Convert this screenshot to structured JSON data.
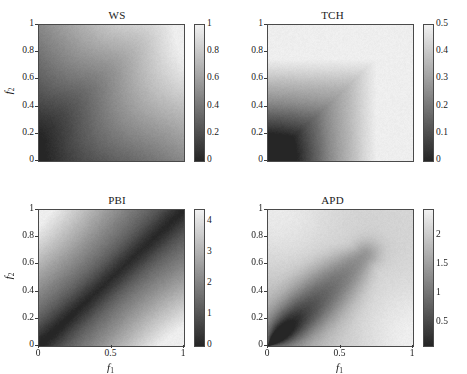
{
  "figure": {
    "background": "#ffffff",
    "colormap": "grayscale",
    "colormap_low": "#262626",
    "colormap_high": "#f2f2f2",
    "axis_label_x": "f",
    "axis_label_x_sub": "1",
    "axis_label_y": "f",
    "axis_label_y_sub": "2",
    "x_ticks": [
      "0",
      "0.5",
      "1"
    ],
    "x_tick_values": [
      0,
      0.5,
      1
    ],
    "y_ticks": [
      "0",
      "0.2",
      "0.4",
      "0.6",
      "0.8",
      "1"
    ],
    "y_tick_values": [
      0,
      0.2,
      0.4,
      0.6,
      0.8,
      1
    ]
  },
  "chart_data": [
    {
      "type": "heatmap",
      "title": "WS",
      "xlabel": "f1",
      "ylabel": "f2",
      "xlim": [
        0,
        1
      ],
      "ylim": [
        0,
        1
      ],
      "x_ticks": [
        0,
        0.5,
        1
      ],
      "x_tick_labels": [
        "0",
        "0.5",
        "1"
      ],
      "y_ticks": [
        0,
        0.2,
        0.4,
        0.6,
        0.8,
        1
      ],
      "y_tick_labels": [
        "0",
        "0.2",
        "0.4",
        "0.6",
        "0.8",
        "1"
      ],
      "colorbar": {
        "ticks": [
          0,
          0.2,
          0.4,
          0.6,
          0.8,
          1
        ],
        "tick_labels": [
          "0",
          "0.2",
          "0.4",
          "0.6",
          "0.8",
          "1"
        ],
        "vmin": 0,
        "vmax": 1,
        "position": "right"
      },
      "field": "ws",
      "description": "Weighted sum: value increases smoothly along the diagonal from dark lower-left to light upper-right, with a faint ridge band parallel to the anti-diagonal.",
      "grid": false
    },
    {
      "type": "heatmap",
      "title": "TCH",
      "xlabel": "f1",
      "ylabel": "f2",
      "xlim": [
        0,
        1
      ],
      "ylim": [
        0,
        1
      ],
      "x_ticks": [
        0,
        0.5,
        1
      ],
      "x_tick_labels": [
        "0",
        "0.5",
        "1"
      ],
      "y_ticks": [
        0,
        0.2,
        0.4,
        0.6,
        0.8,
        1
      ],
      "y_tick_labels": [
        "0",
        "0.2",
        "0.4",
        "0.6",
        "0.8",
        "1"
      ],
      "colorbar": {
        "ticks": [
          0,
          0.1,
          0.2,
          0.3,
          0.4,
          0.5
        ],
        "tick_labels": [
          "0",
          "0.1",
          "0.2",
          "0.3",
          "0.4",
          "0.5"
        ],
        "vmin": 0,
        "vmax": 0.5,
        "position": "right"
      },
      "field": "tch",
      "description": "Tchebycheff: dark in the lower-left corner with L-shaped stepped contours; light along the top and right edges.",
      "grid": false
    },
    {
      "type": "heatmap",
      "title": "PBI",
      "xlabel": "f1",
      "ylabel": "f2",
      "xlim": [
        0,
        1
      ],
      "ylim": [
        0,
        1
      ],
      "x_ticks": [
        0,
        0.5,
        1
      ],
      "x_tick_labels": [
        "0",
        "0.5",
        "1"
      ],
      "y_ticks": [
        0,
        0.2,
        0.4,
        0.6,
        0.8,
        1
      ],
      "y_tick_labels": [
        "0",
        "0.2",
        "0.4",
        "0.6",
        "0.8",
        "1"
      ],
      "colorbar": {
        "ticks": [
          0,
          1,
          2,
          3,
          4
        ],
        "tick_labels": [
          "0",
          "1",
          "2",
          "3",
          "4"
        ],
        "vmin": 0,
        "vmax": 4.4,
        "position": "right"
      },
      "field": "pbi",
      "description": "PBI: dark diagonal valley along f1 = f2, brightening toward the upper-left and lower-right corners.",
      "grid": false
    },
    {
      "type": "heatmap",
      "title": "APD",
      "xlabel": "f1",
      "ylabel": "f2",
      "xlim": [
        0,
        1
      ],
      "ylim": [
        0,
        1
      ],
      "x_ticks": [
        0,
        0.5,
        1
      ],
      "x_tick_labels": [
        "0",
        "0.5",
        "1"
      ],
      "y_ticks": [
        0,
        0.2,
        0.4,
        0.6,
        0.8,
        1
      ],
      "y_tick_labels": [
        "0",
        "0.2",
        "0.4",
        "0.6",
        "0.8",
        "1"
      ],
      "colorbar": {
        "ticks": [
          0.5,
          1,
          1.5,
          2
        ],
        "tick_labels": [
          "0.5",
          "1",
          "1.5",
          "2"
        ],
        "vmin": 0.1,
        "vmax": 2.45,
        "position": "right"
      },
      "field": "apd",
      "description": "APD: dark wedge emanating from the lower-left corner and narrowing to a point near (0.65, 0.65); bright elsewhere.",
      "grid": false
    }
  ]
}
